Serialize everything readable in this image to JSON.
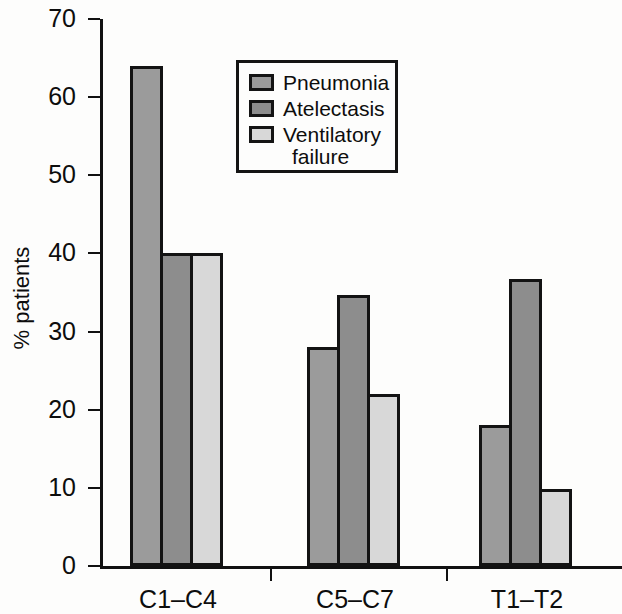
{
  "chart_data": {
    "type": "bar",
    "title": "",
    "xlabel": "",
    "ylabel": "% patients",
    "ylim": [
      0,
      70
    ],
    "ytick_labels": [
      "70",
      "60",
      "50",
      "40",
      "30",
      "20",
      "10",
      "0"
    ],
    "ytick_values": [
      70,
      60,
      50,
      40,
      30,
      20,
      10,
      0
    ],
    "grid": false,
    "legend_position": "upper-center",
    "categories": [
      "C1–C4",
      "C5–C7",
      "T1–T2"
    ],
    "series": [
      {
        "name": "Pneumonia",
        "color": "#9b9b9b",
        "values": [
          64,
          28,
          18
        ]
      },
      {
        "name": "Atelectasis",
        "color": "#8d8d8d",
        "values": [
          40,
          34.7,
          36.7
        ]
      },
      {
        "name": "Ventilatory failure",
        "color": "#d8d8d8",
        "values": [
          40,
          22,
          9.8
        ]
      }
    ]
  },
  "legend": {
    "entries": [
      {
        "label": "Pneumonia",
        "label_line2": ""
      },
      {
        "label": "Atelectasis",
        "label_line2": ""
      },
      {
        "label": "Ventilatory",
        "label_line2": "failure"
      }
    ]
  },
  "axes": {
    "y_title": "% patients",
    "y_labels": [
      "70",
      "60",
      "50",
      "40",
      "30",
      "20",
      "10",
      "0"
    ],
    "x_labels": [
      "C1–C4",
      "C5–C7",
      "T1–T2"
    ]
  },
  "colors": {
    "series1": "#9b9b9b",
    "series2": "#8d8d8d",
    "series3": "#d8d8d8",
    "outline": "#131313",
    "text": "#0d0d0d",
    "background": "#fdfdfc"
  }
}
